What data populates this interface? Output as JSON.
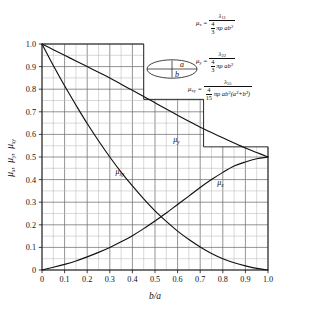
{
  "chart_data": {
    "type": "line",
    "title": "",
    "xlabel": "b/a",
    "ylabel": "μₓ , μᵧ , μₓᵧ",
    "xlim": [
      0,
      1.0
    ],
    "ylim": [
      0,
      1.0
    ],
    "grid": true,
    "legend_position": "inline-curve-labels",
    "xticks": [
      "0",
      "0.1",
      "0.2",
      "0.3",
      "0.4",
      "0.5",
      "0.6",
      "0.7",
      "0.8",
      "0.9",
      "1.0"
    ],
    "yticks": [
      "0",
      "0.1",
      "0.2",
      "0.3",
      "0.4",
      "0.5",
      "0.6",
      "0.7",
      "0.8",
      "0.9",
      "1.0"
    ],
    "x": [
      0,
      0.05,
      0.1,
      0.15,
      0.2,
      0.25,
      0.3,
      0.35,
      0.4,
      0.45,
      0.5,
      0.55,
      0.6,
      0.65,
      0.7,
      0.75,
      0.8,
      0.85,
      0.9,
      0.95,
      1.0
    ],
    "series": [
      {
        "name": "μ_y",
        "label": "μᵧ",
        "label_x": 0.595,
        "label_y": 0.565,
        "values": [
          1.0,
          0.975,
          0.95,
          0.925,
          0.9,
          0.875,
          0.85,
          0.822,
          0.795,
          0.768,
          0.74,
          0.712,
          0.685,
          0.658,
          0.632,
          0.608,
          0.585,
          0.562,
          0.54,
          0.52,
          0.5
        ]
      },
      {
        "name": "μ_x",
        "label": "μₓ",
        "label_x": 0.79,
        "label_y": 0.375,
        "values": [
          0.0,
          0.012,
          0.025,
          0.04,
          0.058,
          0.078,
          0.1,
          0.125,
          0.152,
          0.183,
          0.217,
          0.252,
          0.29,
          0.327,
          0.365,
          0.4,
          0.432,
          0.46,
          0.478,
          0.492,
          0.5
        ]
      },
      {
        "name": "μ_xy",
        "label": "μₓᵧ",
        "label_x": 0.345,
        "label_y": 0.425,
        "values": [
          1.0,
          0.905,
          0.815,
          0.73,
          0.648,
          0.572,
          0.5,
          0.433,
          0.372,
          0.315,
          0.262,
          0.215,
          0.172,
          0.135,
          0.102,
          0.073,
          0.05,
          0.032,
          0.018,
          0.007,
          0.0
        ]
      }
    ],
    "annotations": [
      {
        "name": "mu-x-formula",
        "lhs": "μ",
        "lhs_sub": "x",
        "num": "λ",
        "num_sub": "11",
        "den_frac_n": "4",
        "den_frac_d": "3",
        "den_rest": "πρ ab",
        "den_sup": "2"
      },
      {
        "name": "mu-y-formula",
        "lhs": "μ",
        "lhs_sub": "y",
        "num": "λ",
        "num_sub": "22",
        "den_frac_n": "4",
        "den_frac_d": "3",
        "den_rest": "πρ ab",
        "den_sup": "2"
      },
      {
        "name": "mu-xy-formula",
        "lhs": "μ",
        "lhs_sub": "xy",
        "num": "λ",
        "num_sub": "55",
        "den_frac_n": "4",
        "den_frac_d": "15",
        "den_rest": "πρ ab",
        "den_sup": "2",
        "den_tail": "(a²+b²)"
      }
    ],
    "inset": {
      "name": "ellipse-diagram",
      "label_a": "a",
      "label_b": "b"
    }
  }
}
